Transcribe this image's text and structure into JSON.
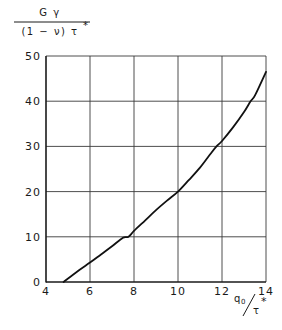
{
  "chart_data": {
    "type": "line",
    "title": "",
    "xlabel": "q0 / τ*",
    "ylabel": "G γ / ((1 − ν) τ*)",
    "ylabel_parts": {
      "numerator": "G γ",
      "denominator": "(1 − ν) τ",
      "denominator_sup": "*"
    },
    "xlabel_parts": {
      "q": "q",
      "q_sub": "0",
      "slash": "/",
      "tau": "τ",
      "tau_sup": "*"
    },
    "xlim": [
      4,
      14
    ],
    "ylim": [
      0,
      50
    ],
    "x_ticks": [
      4,
      6,
      8,
      10,
      12,
      14
    ],
    "y_ticks": [
      0,
      10,
      20,
      30,
      40,
      50
    ],
    "x_tick_labels": [
      "4",
      "6",
      "8",
      "10",
      "12",
      "14"
    ],
    "y_tick_labels": [
      "0",
      "10",
      "20",
      "30",
      "40",
      "50"
    ],
    "grid": true,
    "legend": null,
    "series": [
      {
        "name": "curve",
        "color": "#111111",
        "x": [
          4.8,
          5.5,
          6.0,
          6.5,
          7.0,
          7.5,
          7.75,
          8.0,
          8.5,
          9.0,
          9.5,
          10.0,
          10.5,
          11.0,
          11.5,
          11.75,
          12.0,
          12.5,
          13.0,
          13.3,
          13.5,
          14.0
        ],
        "y": [
          0,
          2.6,
          4.3,
          6.1,
          7.9,
          9.8,
          10.0,
          11.3,
          13.6,
          15.9,
          18.0,
          20.0,
          22.6,
          25.3,
          28.5,
          30.0,
          31.2,
          34.2,
          37.6,
          40.0,
          41.3,
          46.5
        ]
      }
    ]
  },
  "colors": {
    "axis": "#1a1a1a",
    "grid": "#3a3a3a",
    "curve": "#111111",
    "background": "#ffffff"
  }
}
